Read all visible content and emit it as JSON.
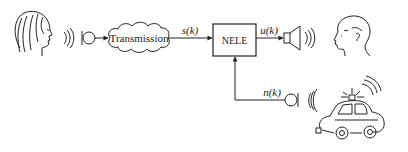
{
  "diagram": {
    "nodes": {
      "speaker_person": {
        "label": "",
        "kind": "female-face"
      },
      "mic_in": {
        "kind": "microphone"
      },
      "channel": {
        "label": "Transmission",
        "kind": "cloud"
      },
      "nele": {
        "label": "NELE",
        "kind": "box"
      },
      "loudspeaker": {
        "kind": "loudspeaker"
      },
      "listener": {
        "kind": "male-face"
      },
      "mic_noise": {
        "kind": "microphone"
      },
      "noise_source": {
        "kind": "police-car"
      }
    },
    "signals": {
      "s": "s(k)",
      "u": "u(k)",
      "n": "n(k)"
    },
    "edges": [
      {
        "from": "mic_in",
        "to": "channel"
      },
      {
        "from": "channel",
        "to": "nele",
        "label": "s(k)"
      },
      {
        "from": "nele",
        "to": "loudspeaker",
        "label": "u(k)"
      },
      {
        "from": "mic_noise",
        "to": "nele",
        "label": "n(k)"
      }
    ],
    "colors": {
      "ink": "#222222",
      "background": "#ffffff"
    }
  }
}
